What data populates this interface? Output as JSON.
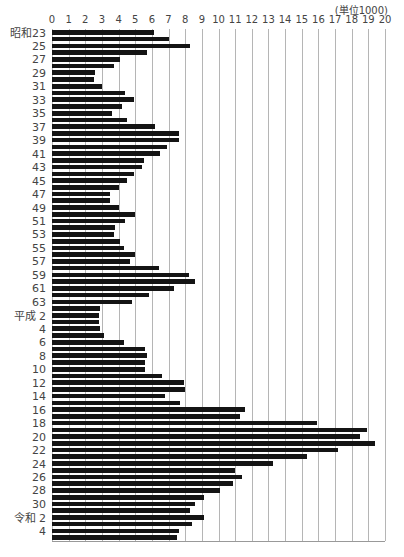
{
  "chart_data": {
    "type": "bar",
    "orientation": "horizontal",
    "title": "",
    "unit_label": "(単位1000)",
    "xlabel": "",
    "ylabel": "",
    "xlim": [
      0,
      20
    ],
    "x_ticks": [
      "0",
      "1",
      "2",
      "3",
      "4",
      "5",
      "6",
      "7",
      "8",
      "9",
      "10",
      "11",
      "12",
      "13",
      "14",
      "15",
      "16",
      "17",
      "18",
      "19",
      "20"
    ],
    "grid": true,
    "legend": null,
    "bar_color": "#141414",
    "categories": [
      "昭和23",
      "24",
      "25",
      "26",
      "27",
      "28",
      "29",
      "30",
      "31",
      "32",
      "33",
      "34",
      "35",
      "36",
      "37",
      "38",
      "39",
      "40",
      "41",
      "42",
      "43",
      "44",
      "45",
      "46",
      "47",
      "48",
      "49",
      "50",
      "51",
      "52",
      "53",
      "54",
      "55",
      "56",
      "57",
      "58",
      "59",
      "60",
      "61",
      "62",
      "63",
      "平成元",
      "平成2",
      "3",
      "4",
      "5",
      "6",
      "7",
      "8",
      "9",
      "10",
      "11",
      "12",
      "13",
      "14",
      "15",
      "16",
      "17",
      "18",
      "19",
      "20",
      "21",
      "22",
      "23",
      "24",
      "25",
      "26",
      "27",
      "28",
      "29",
      "30",
      "令和元",
      "令和2",
      "3",
      "4",
      "5"
    ],
    "tick_labels": [
      "昭和23",
      "",
      "25",
      "",
      "27",
      "",
      "29",
      "",
      "31",
      "",
      "33",
      "",
      "35",
      "",
      "37",
      "",
      "39",
      "",
      "41",
      "",
      "43",
      "",
      "45",
      "",
      "47",
      "",
      "49",
      "",
      "51",
      "",
      "53",
      "",
      "55",
      "",
      "57",
      "",
      "59",
      "",
      "61",
      "",
      "63",
      "",
      "平成 2",
      "",
      "4",
      "",
      "6",
      "",
      "8",
      "",
      "10",
      "",
      "12",
      "",
      "14",
      "",
      "16",
      "",
      "18",
      "",
      "20",
      "",
      "22",
      "",
      "24",
      "",
      "26",
      "",
      "28",
      "",
      "30",
      "",
      "令和 2",
      "",
      "4",
      ""
    ],
    "values": [
      6.1,
      7.0,
      8.3,
      5.7,
      4.1,
      3.7,
      2.6,
      2.5,
      3.0,
      4.4,
      4.9,
      4.2,
      3.6,
      4.5,
      6.2,
      7.6,
      7.6,
      6.9,
      6.5,
      5.5,
      5.4,
      4.9,
      4.5,
      4.0,
      3.5,
      3.5,
      4.0,
      5.0,
      4.4,
      3.8,
      3.7,
      4.1,
      4.3,
      5.0,
      4.7,
      6.4,
      8.2,
      8.6,
      7.3,
      5.8,
      4.8,
      2.9,
      2.8,
      2.8,
      2.9,
      3.1,
      4.3,
      5.6,
      5.7,
      5.6,
      5.6,
      6.6,
      7.9,
      8.0,
      6.8,
      7.7,
      11.6,
      11.3,
      15.9,
      18.9,
      18.5,
      19.4,
      17.2,
      15.3,
      13.3,
      11.0,
      11.4,
      10.9,
      10.1,
      9.1,
      8.6,
      8.3,
      9.1,
      8.4,
      7.6,
      7.5
    ]
  }
}
